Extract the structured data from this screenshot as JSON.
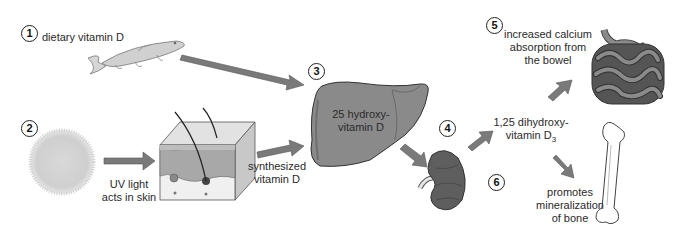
{
  "steps": [
    {
      "number": "1",
      "label": "dietary vitamin D"
    },
    {
      "number": "2",
      "label_lines": [
        "UV light",
        "acts in skin"
      ]
    },
    {
      "number": "3",
      "label_lines": [
        "25 hydroxy-",
        "vitamin D"
      ]
    },
    {
      "number": "4",
      "label_lines": [
        "1,25 dihydroxy-",
        "vitamin D"
      ],
      "subscript": "3"
    },
    {
      "number": "5",
      "label_lines": [
        "increased calcium",
        "absorption from",
        "the bowel"
      ]
    },
    {
      "number": "6",
      "label_lines": [
        "promotes",
        "mineralization",
        "of bone"
      ]
    }
  ],
  "skin_output": {
    "label_lines": [
      "synthesized",
      "vitamin D"
    ]
  },
  "icons": [
    "fish-icon",
    "sun-icon",
    "skin-cross-section-icon",
    "liver-icon",
    "kidney-icon",
    "intestine-icon",
    "bone-icon",
    "arrow-icon"
  ],
  "colors": {
    "arrow": "#7a7a7a",
    "arrow_edge": "#555555",
    "organ": "#8a8a8a",
    "organ_dark": "#5e5e5e",
    "outline": "#333333"
  }
}
